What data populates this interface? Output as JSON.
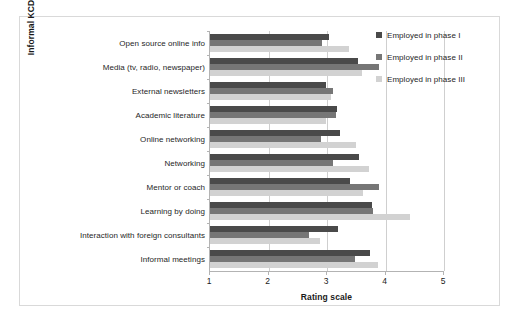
{
  "chart_data": {
    "type": "bar",
    "orientation": "horizontal",
    "title": "",
    "xlabel": "Rating scale",
    "ylabel": "Informal KCD mechanisms",
    "xlim": [
      1,
      5
    ],
    "xticks": [
      1,
      2,
      3,
      4,
      5
    ],
    "xtick_labels": [
      "1",
      "2",
      "3",
      "4",
      "5"
    ],
    "grid": true,
    "legend_position": "top-right",
    "categories": [
      "Open source online info",
      "Media (tv, radio, newspaper)",
      "External newsletters",
      "Academic literature",
      "Online networking",
      "Networking",
      "Mentor or coach",
      "Learning by doing",
      "Interaction with foreign consultants",
      "Informal meetings"
    ],
    "series": [
      {
        "name": "Employed in phase I",
        "color": "#4a4a4a",
        "values": [
          3.04,
          3.53,
          2.99,
          3.17,
          3.22,
          3.55,
          3.4,
          3.77,
          3.18,
          3.73
        ]
      },
      {
        "name": "Employed in phase II",
        "color": "#767676",
        "values": [
          2.92,
          3.89,
          3.1,
          3.15,
          2.9,
          3.11,
          3.89,
          3.79,
          2.7,
          3.48
        ]
      },
      {
        "name": "Employed in phase III",
        "color": "#d2d2d2",
        "values": [
          3.37,
          3.6,
          3.06,
          2.98,
          3.49,
          3.71,
          3.62,
          4.42,
          2.88,
          3.87
        ]
      }
    ]
  },
  "legend": {
    "items": [
      {
        "label": "Employed in phase I",
        "swatch": "#4a4a4a"
      },
      {
        "label": "Employed in phase II",
        "swatch": "#767676"
      },
      {
        "label": "Employed in phase III",
        "swatch": "#d2d2d2"
      }
    ]
  },
  "axes": {
    "x_title": "Rating scale",
    "y_title": "Informal KCD mechanisms"
  },
  "colors": {
    "frame": "#d9d9d9",
    "gridline": "#cfcfcf",
    "axis": "#b3b3b3",
    "text": "#262626",
    "background": "#ffffff"
  }
}
